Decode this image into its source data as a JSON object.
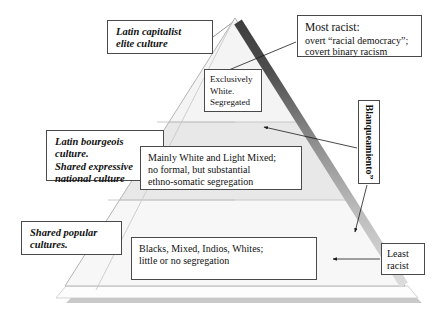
{
  "figure": {
    "type": "pyramid-diagram",
    "background_color": "#ffffff",
    "title": ""
  },
  "pyramid": {
    "apex_label": "",
    "tiers": [
      {
        "name": "top-tier",
        "fill": "#f2f2f2"
      },
      {
        "name": "middle-tier",
        "fill": "#e9e9e9"
      },
      {
        "name": "bottom-tier",
        "fill": "#f6f6f6"
      }
    ],
    "gradient_edge": {
      "name": "blanqueamiento-gradient-edge",
      "top_color": "#4d4d4d",
      "bottom_color": "#d9d9d9"
    },
    "base_plinth": {
      "fill": "#fdfdfd",
      "shadow": "#b8b8b8"
    }
  },
  "left_labels": [
    {
      "id": "latin-capitalist-elite-culture",
      "lines": [
        "Latin capitalist",
        "elite culture"
      ]
    },
    {
      "id": "latin-bourgeois-culture",
      "lines": [
        "Latin bourgeois",
        "culture.",
        "Shared expressive",
        "national culture"
      ]
    },
    {
      "id": "shared-popular-cultures",
      "lines": [
        "Shared popular",
        "cultures."
      ]
    }
  ],
  "tier_descriptions": [
    {
      "id": "exclusively-white-segregated",
      "lines": [
        "Exclusively",
        "White.",
        "Segregated"
      ]
    },
    {
      "id": "mainly-white-light-mixed",
      "lines": [
        "Mainly White and Light Mixed;",
        "no formal, but substantial",
        "ethno-somatic segregation"
      ]
    },
    {
      "id": "blacks-mixed-indios-whites",
      "lines": [
        "Blacks, Mixed, Indios, Whites;",
        "little or no segregation"
      ]
    }
  ],
  "right_annotations": {
    "most_racist": {
      "id": "most-racist",
      "head": "Most racist:",
      "lines": [
        "overt “racial democracy”;",
        "covert binary racism"
      ]
    },
    "blanqueamiento": {
      "id": "blanqueamiento",
      "text": "Blanqueamiento”"
    },
    "least_racist": {
      "id": "least-racist",
      "lines": [
        "Least",
        "racist"
      ]
    }
  },
  "connectors": [
    {
      "name": "latin-capitalist-to-apex",
      "arrow": false
    },
    {
      "name": "most-racist-to-upper-edge",
      "arrow": true
    },
    {
      "name": "blanqueamiento-to-middle-tier",
      "arrow": true
    },
    {
      "name": "blanqueamiento-to-lower-edge",
      "arrow": true
    },
    {
      "name": "least-racist-to-bottom-tier",
      "arrow": true
    }
  ]
}
